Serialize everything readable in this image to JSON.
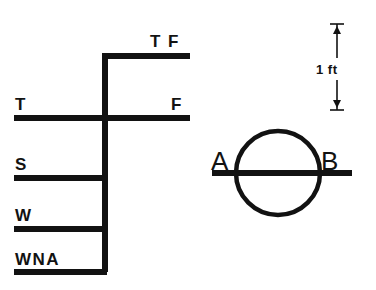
{
  "diagram": {
    "ink_color": "#121212",
    "background_color": "#ffffff",
    "load_line_marks": [
      {
        "code": "TF",
        "label": "T F",
        "meaning_side": "right",
        "line_y": 56,
        "line_x1": 103,
        "line_x2": 190,
        "label_x": 150,
        "label_y": 47
      },
      {
        "code": "T",
        "label": "T",
        "meaning_side": "left",
        "line_y": 118,
        "line_x1": 14,
        "line_x2": 106,
        "label_x": 15,
        "label_y": 110
      },
      {
        "code": "F",
        "label": "F",
        "meaning_side": "right",
        "line_y": 118,
        "line_x1": 106,
        "line_x2": 190,
        "label_x": 171,
        "label_y": 110
      },
      {
        "code": "S",
        "label": "S",
        "meaning_side": "left",
        "line_y": 178,
        "line_x1": 14,
        "line_x2": 107,
        "label_x": 15,
        "label_y": 170
      },
      {
        "code": "W",
        "label": "W",
        "meaning_side": "left",
        "line_y": 229,
        "line_x1": 14,
        "line_x2": 107,
        "label_x": 15,
        "label_y": 221
      },
      {
        "code": "WNA",
        "label": "WNA",
        "meaning_side": "left",
        "line_y": 272,
        "line_x1": 14,
        "line_x2": 107,
        "label_x": 15,
        "label_y": 265
      }
    ],
    "vertical_stem": {
      "x": 105,
      "y_top": 56,
      "y_bottom": 272
    },
    "plimsoll_disc": {
      "center_x": 278,
      "center_y": 173,
      "radius": 42,
      "deck_line_x1": 212,
      "deck_line_x2": 352,
      "deck_line_y": 173,
      "left_label": "A",
      "right_label": "B",
      "left_label_x": 211,
      "left_label_y": 170,
      "right_label_x": 321,
      "right_label_y": 170
    },
    "scale_bar": {
      "label": "1 ft",
      "label_x": 318,
      "label_y": 72,
      "axis_x": 337,
      "y_top": 24,
      "y_bottom": 110,
      "tick_half_width": 7
    }
  }
}
